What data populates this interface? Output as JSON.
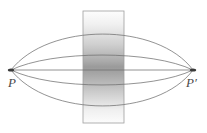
{
  "figure": {
    "type": "optics-path-diagram",
    "width": 207,
    "height": 133,
    "background_color": "#ffffff",
    "labels": {
      "source_point": "P",
      "image_point": "P′"
    },
    "source_point": {
      "x": 11,
      "y": 70,
      "marker": "dot"
    },
    "image_point": {
      "x": 193,
      "y": 70,
      "marker": "dot"
    },
    "slab": {
      "name": "gradient-slab",
      "x": 83,
      "y": 11,
      "width": 41,
      "height": 112,
      "border_color": "#9a9a9a",
      "gradient_top_color": "#fcfcfc",
      "gradient_mid_color": "#9a9a9a",
      "gradient_bottom_color": "#fbfbfb"
    },
    "path_color": "#6f6f6f",
    "path_width": 0.7,
    "paths": [
      {
        "name": "outer-upper-path",
        "peak_y": 26,
        "bulge": -44
      },
      {
        "name": "inner-upper-path",
        "peak_y": 53,
        "bulge": -17
      },
      {
        "name": "axis-path",
        "peak_y": 70,
        "bulge": 0
      },
      {
        "name": "inner-lower-path",
        "peak_y": 87,
        "bulge": 17
      },
      {
        "name": "outer-lower-path",
        "peak_y": 114,
        "bulge": 44
      }
    ]
  }
}
